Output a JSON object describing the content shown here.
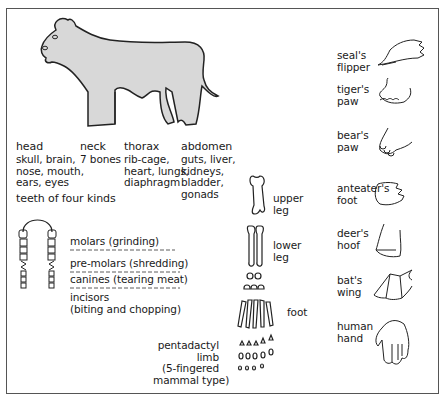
{
  "animal": {
    "regions": [
      {
        "name": "head",
        "details": "skull, brain,\nnose, mouth,\nears, eyes"
      },
      {
        "name": "neck",
        "details": "7 bones"
      },
      {
        "name": "thorax",
        "details": "rib-cage,\nheart, lungs,\ndiaphragm"
      },
      {
        "name": "abdomen",
        "details": "guts, liver,\nkidneys,\nbladder,\ngonads"
      }
    ]
  },
  "teeth": {
    "title": "teeth of four kinds",
    "kinds": [
      {
        "label": "molars (grinding)"
      },
      {
        "label": "pre-molars (shredding)"
      },
      {
        "label": "canines (tearing meat)"
      },
      {
        "label": "incisors\n(biting and chopping)"
      }
    ]
  },
  "limb": {
    "parts": [
      {
        "label": "upper\nleg"
      },
      {
        "label": "lower\nleg"
      },
      {
        "label": "foot"
      }
    ],
    "caption": "pentadactyl\nlimb\n(5-fingered\nmammal type)"
  },
  "adaptations": [
    {
      "label": "seal's\nflipper"
    },
    {
      "label": "tiger's\npaw"
    },
    {
      "label": "bear's\npaw"
    },
    {
      "label": "anteater's\nfoot"
    },
    {
      "label": "deer's\nhoof"
    },
    {
      "label": "bat's\nwing"
    },
    {
      "label": "human\nhand"
    }
  ],
  "colors": {
    "body_fill": "#d8d8d8",
    "stroke": "#222222",
    "frame": "#555555"
  }
}
